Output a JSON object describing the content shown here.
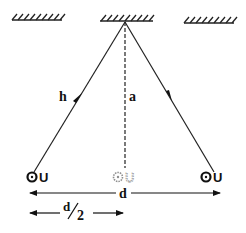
{
  "diagram": {
    "type": "reflection geometry (source, mirror, observer)",
    "colors": {
      "ink": "#111111",
      "faded": "#888888",
      "background": "#ffffff"
    },
    "ceilings": [
      {
        "name": "left-ceiling-hatch",
        "style": "hatched"
      },
      {
        "name": "center-ceiling-hatch",
        "style": "hatched"
      },
      {
        "name": "right-ceiling-hatch",
        "style": "hatched"
      }
    ],
    "labels": {
      "h": "h",
      "a": "a",
      "d": "d",
      "d_half_num": "d",
      "d_half_den": "2"
    },
    "objects": {
      "left": {
        "circle": "o",
        "letter": "U",
        "state": "solid"
      },
      "center": {
        "circle": "o",
        "letter": "U",
        "state": "faded"
      },
      "right": {
        "circle": "o",
        "letter": "U",
        "state": "solid"
      }
    },
    "rays": [
      {
        "name": "incident-ray",
        "from": "left object",
        "to": "ceiling apex",
        "arrow": "up"
      },
      {
        "name": "reflected-ray",
        "from": "ceiling apex",
        "to": "right object",
        "arrow": "down"
      }
    ],
    "dimensions": [
      {
        "name": "full-distance",
        "label": "d",
        "span": "left object to right object"
      },
      {
        "name": "half-distance",
        "label": "d/2",
        "span": "left object to midpoint"
      }
    ]
  }
}
